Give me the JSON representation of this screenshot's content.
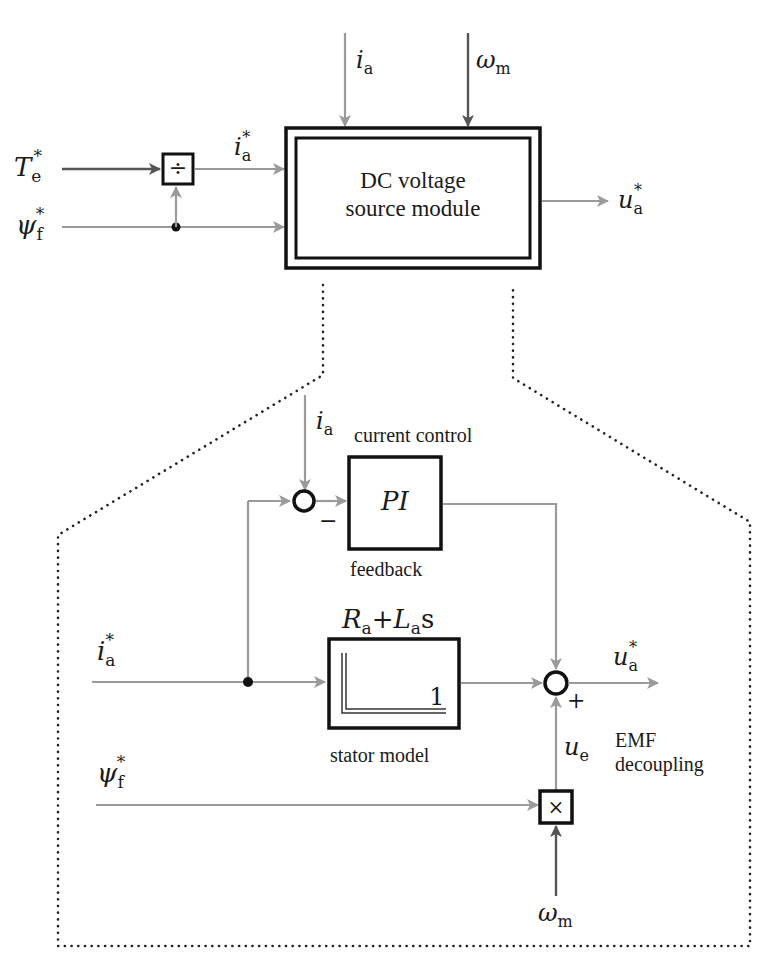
{
  "top": {
    "module_label_line1": "DC voltage",
    "module_label_line2": "source module",
    "inputs": {
      "torque_ref": {
        "sym": "T",
        "sub": "e",
        "sup": "*"
      },
      "flux_ref": {
        "sym": "ψ",
        "sub": "f",
        "sup": "*"
      },
      "current_ref": {
        "sym": "i",
        "sub": "a",
        "sup": "*"
      },
      "current_fb": {
        "sym": "i",
        "sub": "a"
      },
      "speed": {
        "sym": "ω",
        "sub": "m"
      }
    },
    "divider_symbol": "÷",
    "output": {
      "sym": "u",
      "sub": "a",
      "sup": "*"
    }
  },
  "detail": {
    "current_control_label": "current control",
    "feedback_label": "feedback",
    "pi_label": "PI",
    "minus_sign": "−",
    "plus_sign": "+",
    "stator_tf_num": {
      "R": "R",
      "Rsub": "a",
      "plus": "+",
      "L": "L",
      "Lsub": "a",
      "s": "s"
    },
    "stator_tf_den": "1",
    "stator_model_label": "stator model",
    "emf_label_line1": "EMF",
    "emf_label_line2": "decoupling",
    "multiply_symbol": "×",
    "inputs": {
      "current_fb": {
        "sym": "i",
        "sub": "a"
      },
      "current_ref": {
        "sym": "i",
        "sub": "a",
        "sup": "*"
      },
      "flux_ref": {
        "sym": "ψ",
        "sub": "f",
        "sup": "*"
      },
      "speed": {
        "sym": "ω",
        "sub": "m"
      }
    },
    "emf_signal": {
      "sym": "u",
      "sub": "e"
    },
    "output": {
      "sym": "u",
      "sub": "a",
      "sup": "*"
    }
  },
  "colors": {
    "signal_line": "#9a9a9a",
    "dark_signal": "#555555",
    "block_border": "#111111",
    "background": "#ffffff"
  }
}
